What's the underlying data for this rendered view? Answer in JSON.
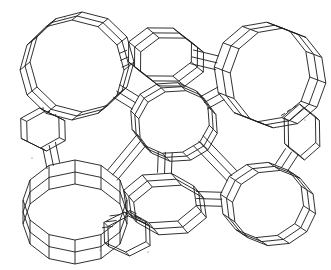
{
  "figure": {
    "kind": "zeolite-framework-line-drawing",
    "colors": {
      "background": "#ffffff",
      "stroke": "#1a1a1a"
    },
    "large_rings": [
      {
        "name": "upper-left-12-ring",
        "sides": 12,
        "layers": 3
      },
      {
        "name": "center-12-ring",
        "sides": 12,
        "layers": 3
      },
      {
        "name": "upper-right-12-ring",
        "sides": 12,
        "layers": 3
      },
      {
        "name": "lower-left-12-ring",
        "sides": 12,
        "layers": 3
      },
      {
        "name": "lower-right-12-ring",
        "sides": 12,
        "layers": 3
      }
    ],
    "small_cages": [
      {
        "name": "upper-middle-cage",
        "sides": 8,
        "layers": 3
      },
      {
        "name": "left-middle-cage",
        "sides": 6,
        "layers": 2
      },
      {
        "name": "lower-middle-cage",
        "sides": 8,
        "layers": 3
      },
      {
        "name": "right-middle-cage",
        "sides": 6,
        "layers": 2
      },
      {
        "name": "bottom-center-cage",
        "sides": 6,
        "layers": 2
      }
    ]
  }
}
